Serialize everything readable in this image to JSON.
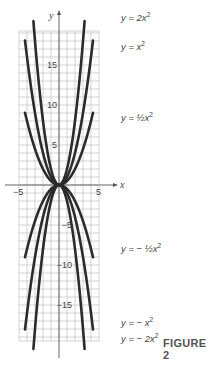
{
  "figure": {
    "caption": "FIGURE 2"
  },
  "chart_data": {
    "type": "line",
    "title": "",
    "xlabel": "x",
    "ylabel": "y",
    "xlim": [
      -5,
      5
    ],
    "ylim": [
      -19.5,
      19.25
    ],
    "grid": true,
    "x_ticks": [
      {
        "value": -5,
        "label": "-5"
      },
      {
        "value": 5,
        "label": "5"
      }
    ],
    "y_ticks": [
      {
        "value": 15,
        "label": "15"
      },
      {
        "value": 10,
        "label": "10"
      },
      {
        "value": 5,
        "label": "5"
      },
      {
        "value": -5,
        "label": "-5"
      },
      {
        "value": -10,
        "label": "-10"
      },
      {
        "value": -15,
        "label": "-15"
      }
    ],
    "series": [
      {
        "name": "y = 2x^2",
        "label_main": "y = 2x",
        "label_sup": "2",
        "coef": 2,
        "x_range": [
          -3.2,
          3.2
        ],
        "label_pos": [
          121,
          21
        ]
      },
      {
        "name": "y = x^2",
        "label_main": "y = x",
        "label_sup": "2",
        "coef": 1,
        "x_range": [
          -4.25,
          4.25
        ],
        "label_pos": [
          121,
          50
        ]
      },
      {
        "name": "y = 1/2 x^2",
        "label_main": "y = ½x",
        "label_sup": "2",
        "coef": 0.5,
        "x_range": [
          -4.25,
          4.25
        ],
        "label_pos": [
          121,
          121
        ]
      },
      {
        "name": "y = -1/2 x^2",
        "label_main": "y = − ½x",
        "label_sup": "2",
        "coef": -0.5,
        "x_range": [
          -4.25,
          4.25
        ],
        "label_pos": [
          121,
          252
        ]
      },
      {
        "name": "y = -x^2",
        "label_main": "y = − x",
        "label_sup": "2",
        "coef": -1,
        "x_range": [
          -4.25,
          4.25
        ],
        "label_pos": [
          121,
          326
        ]
      },
      {
        "name": "y = -2x^2",
        "label_main": "y = − 2x",
        "label_sup": "2",
        "coef": -2,
        "x_range": [
          -3.2,
          3.2
        ],
        "label_pos": [
          121,
          342
        ]
      }
    ],
    "layout": {
      "origin_px": [
        59,
        185
      ],
      "px_per_unit_x": 8,
      "px_per_unit_y": 8,
      "grid_left": 19,
      "grid_right": 99,
      "grid_top": 31,
      "grid_bottom": 341,
      "yaxis_top": 14,
      "yaxis_bottom": 358,
      "xaxis_left": 5,
      "xaxis_right": 114
    }
  }
}
